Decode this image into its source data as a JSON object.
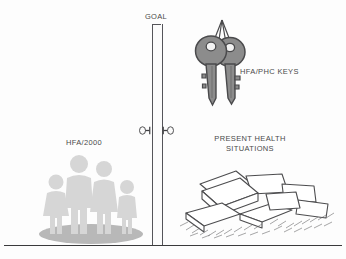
{
  "figure": {
    "background_color": "#fdfdfd",
    "line_color": "#3a3a3c",
    "goal_label": "GOAL",
    "baseline_label": "ground-baseline"
  },
  "left_side": {
    "label": "HFA/2000",
    "illustration_name": "family-group-silhouette",
    "figure_count": 4,
    "figure_color": "#d8d8d8",
    "base_color": "#b5b5b5"
  },
  "right_side": {
    "keys_label": "HFA/PHC KEYS",
    "keys_illustration_name": "two-keys-on-ring",
    "keys_color": "#8c8c8c",
    "keys_outline_color": "#4a4a4c",
    "situations_label_line1": "PRESENT HEALTH",
    "situations_label_line2": "SITUATIONS",
    "papers_illustration_name": "scattered-papers-pile",
    "papers_color": "#ffffff",
    "papers_outline_color": "#4d4d4f"
  },
  "pole": {
    "name": "goal-pole",
    "color": "#55555a",
    "latch_left_name": "pole-latch-left",
    "latch_right_name": "pole-latch-right"
  }
}
